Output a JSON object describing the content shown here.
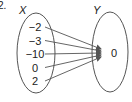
{
  "problem_number": "2.",
  "domain_set": {
    "label": "X",
    "elements": [
      "−2",
      "−3",
      "−10",
      "0",
      "2"
    ]
  },
  "codomain_set": {
    "label": "Y",
    "elements": [
      "0"
    ]
  },
  "mapping": [
    {
      "from": "−2",
      "to": "0"
    },
    {
      "from": "−3",
      "to": "0"
    },
    {
      "from": "−10",
      "to": "0"
    },
    {
      "from": "0",
      "to": "0"
    },
    {
      "from": "2",
      "to": "0"
    }
  ],
  "colors": {
    "stroke": "#555555",
    "text": "#222222"
  }
}
